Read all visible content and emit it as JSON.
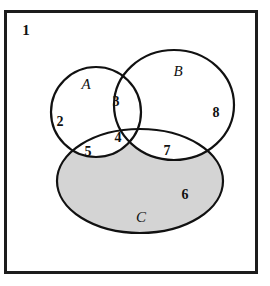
{
  "figure": {
    "kind": "venn-diagram",
    "set_count": 3,
    "frame": {
      "label": "1",
      "label_meaning": "universal-set-region",
      "border_color": "#1c1c1c",
      "fill_color": "#ffffff",
      "border_width_px": 3,
      "x": 4,
      "y": 10,
      "width": 254,
      "height": 264
    },
    "style": {
      "curve_stroke_color": "#111111",
      "curve_stroke_width_px": 2.2,
      "shaded_fill_color": "#d4d4d4",
      "unshaded_fill_color": "#ffffff",
      "text_color": "#111111"
    },
    "sets": [
      {
        "id": "A",
        "label": "A",
        "shape": "circle",
        "cx": 96,
        "cy": 112,
        "rx": 45,
        "ry": 45,
        "label_x": 86,
        "label_y": 86,
        "label_font_size": 15
      },
      {
        "id": "B",
        "label": "B",
        "shape": "circle",
        "cx": 174,
        "cy": 105,
        "rx": 60,
        "ry": 55,
        "label_x": 178,
        "label_y": 73,
        "label_font_size": 15
      },
      {
        "id": "C",
        "label": "C",
        "shape": "ellipse",
        "cx": 140,
        "cy": 181,
        "rx": 83,
        "ry": 52,
        "label_x": 141,
        "label_y": 219,
        "label_font_size": 15,
        "shaded": true
      }
    ],
    "regions": [
      {
        "id": "universe-only",
        "label": "1",
        "sets": [],
        "x": 26,
        "y": 32,
        "font_size": 15,
        "shaded": false
      },
      {
        "id": "A-only",
        "label": "2",
        "sets": [
          "A"
        ],
        "x": 60,
        "y": 123,
        "font_size": 14,
        "shaded": false
      },
      {
        "id": "A-and-B",
        "label": "3",
        "sets": [
          "A",
          "B"
        ],
        "x": 116,
        "y": 103,
        "font_size": 14,
        "shaded": false
      },
      {
        "id": "A-and-B-and-C",
        "label": "4",
        "sets": [
          "A",
          "B",
          "C"
        ],
        "x": 118,
        "y": 139,
        "font_size": 14,
        "shaded": false
      },
      {
        "id": "A-and-C",
        "label": "5",
        "sets": [
          "A",
          "C"
        ],
        "x": 88,
        "y": 153,
        "font_size": 14,
        "shaded": false
      },
      {
        "id": "C-only",
        "label": "6",
        "sets": [
          "C"
        ],
        "x": 185,
        "y": 196,
        "font_size": 14,
        "shaded": true
      },
      {
        "id": "B-and-C",
        "label": "7",
        "sets": [
          "B",
          "C"
        ],
        "x": 167,
        "y": 152,
        "font_size": 14,
        "shaded": false
      },
      {
        "id": "B-only",
        "label": "8",
        "sets": [
          "B"
        ],
        "x": 216,
        "y": 114,
        "font_size": 14,
        "shaded": false
      }
    ]
  }
}
